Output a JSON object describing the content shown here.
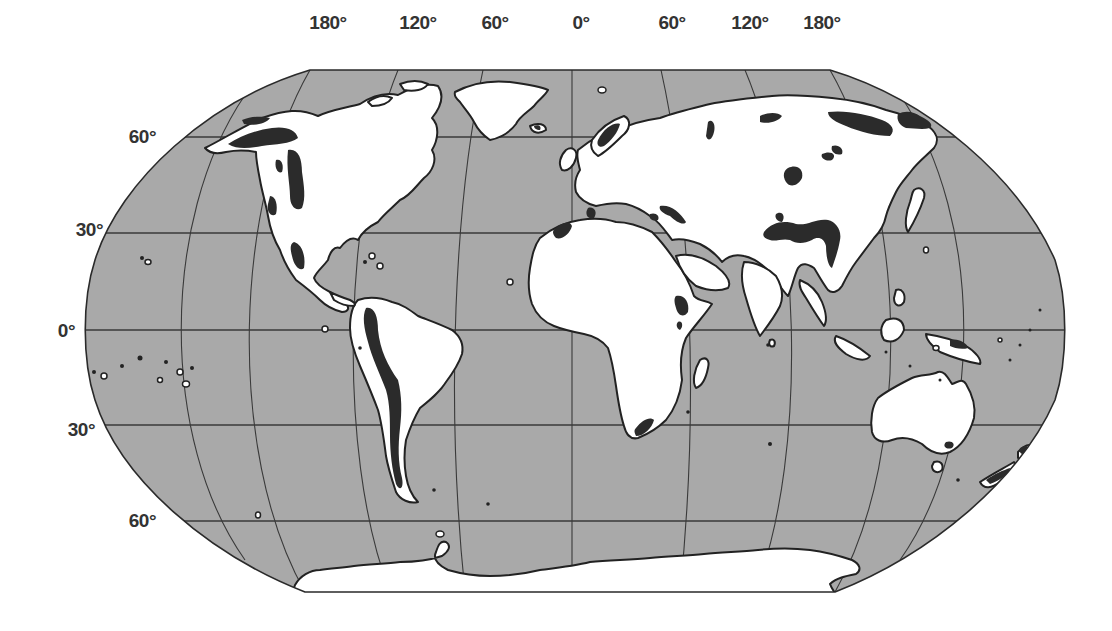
{
  "map": {
    "projection_style": "Robinson-like world map (Pacific-split)",
    "colors": {
      "ocean": "#a9a9a9",
      "land": "#ffffff",
      "highlight": "#2b2b2b",
      "gridline": "#3a3a3a",
      "label": "#333333"
    },
    "longitude_labels": [
      {
        "text": "180°",
        "x": 328
      },
      {
        "text": "120°",
        "x": 418
      },
      {
        "text": "60°",
        "x": 495
      },
      {
        "text": "0°",
        "x": 581
      },
      {
        "text": "60°",
        "x": 672
      },
      {
        "text": "120°",
        "x": 750
      },
      {
        "text": "180°",
        "x": 822
      }
    ],
    "latitude_labels": [
      {
        "text": "60°",
        "y": 137,
        "x": 153
      },
      {
        "text": "30°",
        "y": 230,
        "x": 102
      },
      {
        "text": "0°",
        "y": 331,
        "x": 73
      },
      {
        "text": "30°",
        "y": 430,
        "x": 93
      },
      {
        "text": "60°",
        "y": 521,
        "x": 153
      }
    ],
    "legend": "Dark patches mark highlighted regions (high mountain / glaciated areas) on white landmasses over grey ocean"
  }
}
